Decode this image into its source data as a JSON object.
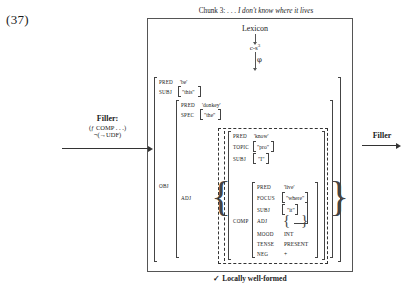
{
  "example_number": "(37)",
  "chunk": {
    "title_prefix": "Chunk 3: . . .",
    "title_italic": "I don't know where it lives"
  },
  "projections": {
    "lexicon": "Lexicon",
    "c_structure": "c-s",
    "c_structure_sup": "3",
    "phi": "φ"
  },
  "filler_left": {
    "title": "Filler:",
    "f_var": "f",
    "formula": "(ƒ    COMP    . . .)",
    "negation": "¬(→UDF)"
  },
  "filler_right": {
    "label": "Filler"
  },
  "caption": {
    "text": "✓ Locally well-formed"
  },
  "fstructure": {
    "outer": [
      {
        "attr": "PRED",
        "val": "'be'"
      },
      {
        "attr": "SUBJ",
        "val": "\"this\""
      },
      {
        "attr": "OBJ",
        "val": ""
      }
    ],
    "obj": [
      {
        "attr": "PRED",
        "val": "'donkey'"
      },
      {
        "attr": "SPEC",
        "val": "\"the\""
      },
      {
        "attr": "ADJ",
        "val": ""
      }
    ],
    "adj": [
      {
        "attr": "PRED",
        "val": "'know'"
      },
      {
        "attr": "TOPIC",
        "val": "\"pro\""
      },
      {
        "attr": "SUBJ",
        "val": "\"I\""
      },
      {
        "attr": "COMP",
        "val": ""
      }
    ],
    "comp": [
      {
        "attr": "PRED",
        "val": "'live'"
      },
      {
        "attr": "FOCUS",
        "val": "\"where\""
      },
      {
        "attr": "SUBJ",
        "val": "\"it\""
      },
      {
        "attr": "ADJ",
        "val": "{    }"
      },
      {
        "attr": "MOOD",
        "val": "INT"
      },
      {
        "attr": "TENSE",
        "val": "PRESENT"
      },
      {
        "attr": "NEG",
        "val": "+"
      }
    ]
  }
}
